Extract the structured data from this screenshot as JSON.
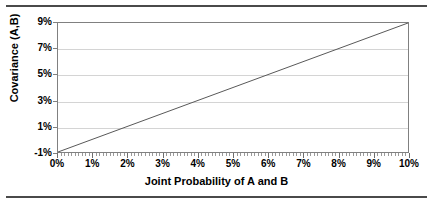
{
  "figure": {
    "background_color": "#ffffff",
    "rule_color": "#4a4a4a",
    "clipped_caption": "Joint Probability of A and B"
  },
  "chart_data": {
    "type": "line",
    "title": "",
    "subtitle": "",
    "xlabel": "Joint Probability of A and B",
    "ylabel": "Covariance (A,B)",
    "x": [
      0,
      1,
      2,
      3,
      4,
      5,
      6,
      7,
      8,
      9,
      10
    ],
    "xtick_labels": [
      "0%",
      "1%",
      "2%",
      "3%",
      "4%",
      "5%",
      "6%",
      "7%",
      "8%",
      "9%",
      "10%"
    ],
    "ytick_labels": [
      "-1%",
      "1%",
      "3%",
      "5%",
      "7%",
      "9%"
    ],
    "ytick_values": [
      -1,
      1,
      3,
      5,
      7,
      9
    ],
    "series": [
      {
        "name": "Covariance (A,B)",
        "values": [
          -1,
          0,
          1,
          2,
          3,
          4,
          5,
          6,
          7,
          8,
          9
        ],
        "color": "#595959",
        "line_width": 1
      }
    ],
    "xlim": [
      0,
      10
    ],
    "ylim": [
      -1,
      9
    ],
    "grid": "horizontal",
    "gridline_color": "#d4d4d4",
    "legend": "none",
    "plot_border_color": "#808080",
    "minor_ticks_per_interval": 10
  }
}
